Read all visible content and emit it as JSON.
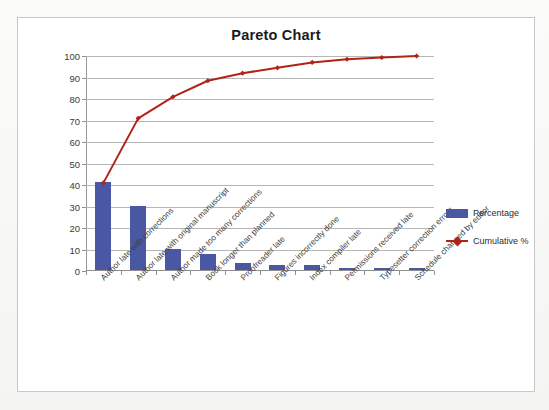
{
  "chart_data": {
    "type": "bar",
    "title": "Pareto Chart",
    "xlabel": "",
    "ylabel": "",
    "ylim": [
      0,
      100
    ],
    "ytick_values": [
      0,
      10,
      20,
      30,
      40,
      50,
      60,
      70,
      80,
      90,
      100
    ],
    "grid": true,
    "legend_position": "right",
    "categories": [
      "Author late with corrections",
      "Author late with original manuscript",
      "Author made too many corrections",
      "Book longer than planned",
      "Proofreader late",
      "Figures incorrectly done",
      "Index compiler late",
      "Permissions received late",
      "Typesetter correction errors",
      "Schedule changed by editor"
    ],
    "series": [
      {
        "name": "Percentage",
        "type": "bar",
        "color": "#4a58a3",
        "values": [
          41,
          30,
          10,
          7.5,
          3.3,
          2.3,
          2.3,
          1,
          1,
          1
        ]
      },
      {
        "name": "Cumulative %",
        "type": "line",
        "color": "#b02418",
        "values": [
          41,
          71,
          81,
          88.5,
          92,
          94.5,
          97,
          98.5,
          99.3,
          100
        ]
      }
    ]
  },
  "legend": {
    "items": [
      {
        "label": "Percentage",
        "key": "bar-key"
      },
      {
        "label": "Cumulative %",
        "key": "line-key"
      }
    ]
  }
}
